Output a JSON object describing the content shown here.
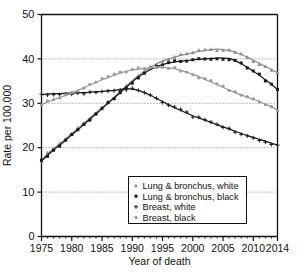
{
  "chart_data": {
    "type": "line",
    "title": "",
    "xlabel": "Year of death",
    "ylabel": "Rate per 100,000",
    "xlim": [
      1975,
      2014
    ],
    "ylim": [
      0,
      50
    ],
    "yticks": [
      0,
      10,
      20,
      30,
      40,
      50
    ],
    "xticks": [
      1975,
      1980,
      1985,
      1990,
      1995,
      2000,
      2005,
      2010,
      2014
    ],
    "grid": "horizontal-dotted at 10, 20, 30, 40",
    "legend_position": "lower-center",
    "x": [
      1975,
      1976,
      1977,
      1978,
      1979,
      1980,
      1981,
      1982,
      1983,
      1984,
      1985,
      1986,
      1987,
      1988,
      1989,
      1990,
      1991,
      1992,
      1993,
      1994,
      1995,
      1996,
      1997,
      1998,
      1999,
      2000,
      2001,
      2002,
      2003,
      2004,
      2005,
      2006,
      2007,
      2008,
      2009,
      2010,
      2011,
      2012,
      2013,
      2014
    ],
    "series": [
      {
        "name": "Lung & bronchus, white",
        "marker": "triangle",
        "color": "#8a8a8a",
        "values": [
          17.2,
          18.6,
          19.8,
          20.9,
          22.0,
          23.2,
          24.3,
          25.5,
          26.7,
          27.9,
          29.0,
          30.2,
          31.4,
          32.6,
          33.9,
          35.1,
          36.2,
          37.2,
          38.1,
          38.9,
          39.5,
          40.0,
          40.4,
          40.8,
          41.1,
          41.4,
          41.7,
          41.9,
          42.1,
          42.2,
          42.1,
          41.9,
          41.5,
          41.0,
          40.4,
          39.7,
          39.0,
          38.3,
          37.6,
          36.9
        ]
      },
      {
        "name": "Lung & bronchus, black",
        "marker": "square",
        "color": "#1a1a1a",
        "values": [
          17.0,
          18.3,
          19.5,
          20.6,
          21.7,
          22.9,
          24.0,
          25.2,
          26.4,
          27.6,
          28.8,
          30.0,
          31.2,
          32.4,
          33.6,
          34.8,
          35.9,
          36.8,
          37.6,
          38.2,
          38.7,
          39.1,
          39.3,
          39.5,
          39.6,
          39.8,
          39.9,
          40.0,
          40.1,
          40.2,
          40.2,
          40.1,
          39.6,
          38.9,
          38.1,
          37.2,
          36.3,
          35.3,
          34.3,
          33.1
        ]
      },
      {
        "name": "Breast, white",
        "marker": "plus",
        "color": "#1a1a1a",
        "values": [
          31.9,
          32.1,
          32.2,
          32.2,
          32.3,
          32.3,
          32.4,
          32.4,
          32.5,
          32.6,
          32.7,
          32.8,
          32.9,
          33.1,
          33.3,
          33.2,
          32.9,
          32.4,
          31.8,
          31.1,
          30.4,
          29.7,
          29.0,
          28.4,
          27.8,
          27.2,
          26.7,
          26.2,
          25.7,
          25.2,
          24.7,
          24.2,
          23.7,
          23.2,
          22.7,
          22.3,
          21.9,
          21.5,
          21.0,
          20.6
        ]
      },
      {
        "name": "Breast, black",
        "marker": "circle",
        "color": "#9a9a9a",
        "values": [
          29.7,
          30.3,
          30.8,
          31.3,
          31.8,
          32.3,
          32.9,
          33.5,
          34.1,
          34.7,
          35.3,
          35.8,
          36.3,
          36.8,
          37.2,
          37.5,
          37.7,
          37.9,
          38.0,
          38.1,
          38.1,
          38.0,
          37.8,
          37.4,
          37.0,
          36.5,
          36.0,
          35.4,
          34.8,
          34.2,
          33.6,
          33.0,
          32.4,
          31.9,
          31.4,
          30.9,
          30.4,
          29.8,
          29.2,
          28.5
        ]
      }
    ],
    "legend": [
      {
        "label": "Lung & bronchus, white",
        "marker": "triangle",
        "color": "#8a8a8a"
      },
      {
        "label": "Lung & bronchus, black",
        "marker": "square",
        "color": "#1a1a1a"
      },
      {
        "label": "Breast, white",
        "marker": "plus",
        "color": "#1a1a1a"
      },
      {
        "label": "Breast, black",
        "marker": "circle",
        "color": "#9a9a9a"
      }
    ]
  },
  "axes": {
    "y_title": "Rate per 100,000",
    "x_title": "Year of death",
    "y_tick_labels": [
      "0",
      "10",
      "20",
      "30",
      "40",
      "50"
    ],
    "x_tick_labels": [
      "1975",
      "1980",
      "1985",
      "1990",
      "1995",
      "2000",
      "2005",
      "2010",
      "2014"
    ]
  }
}
